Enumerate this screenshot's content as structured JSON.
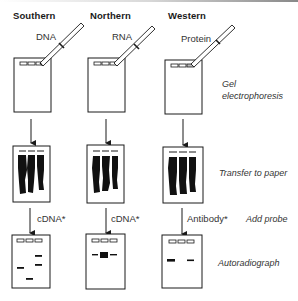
{
  "columns": [
    {
      "title": "Southern",
      "sample": "DNA",
      "probe": "cDNA*"
    },
    {
      "title": "Northern",
      "sample": "RNA",
      "probe": "cDNA*"
    },
    {
      "title": "Western",
      "sample": "Protein",
      "probe": "Antibody*"
    }
  ],
  "steps": {
    "gel_line1": "Gel",
    "gel_line2": "electrophoresis",
    "transfer": "Transfer to paper",
    "probe": "Add probe",
    "autoradiograph": "Autoradiograph"
  },
  "colors": {
    "ink": "#1a1a1a",
    "background": "#ffffff"
  }
}
